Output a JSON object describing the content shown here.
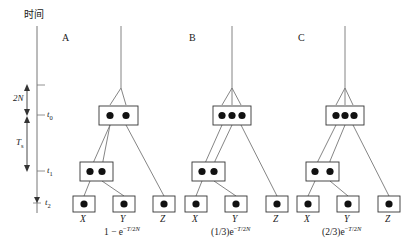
{
  "figure": {
    "width": 408,
    "height": 248,
    "background": "#ffffff",
    "ink_color": "#1a1a1a",
    "line_color": "#555555"
  },
  "axis": {
    "title": "时间",
    "title_meaning": "time",
    "ticks": [
      {
        "id": "t0",
        "label": "t",
        "sub": "0",
        "y": 115
      },
      {
        "id": "t1",
        "label": "t",
        "sub": "1",
        "y": 171
      },
      {
        "id": "t2",
        "label": "t",
        "sub": "2",
        "y": 203
      }
    ],
    "spans": [
      {
        "id": "span-2N",
        "label": "2N",
        "sub": "",
        "from_y": 85,
        "to_y": 115
      },
      {
        "id": "span-T",
        "label": "T",
        "sub": "s",
        "from_y": 117,
        "to_y": 171
      }
    ]
  },
  "panels": [
    {
      "letter": "A",
      "formula_parts": {
        "prefix": "1 − e",
        "exp_minus": "−",
        "exp_var": "T",
        "exp_div": "/2",
        "exp_n": "N"
      },
      "formula_plain": "1 − e−T/2N",
      "ancestral_dots": 2,
      "internal_dots": 2,
      "tips": [
        {
          "label": "X",
          "dots": 1
        },
        {
          "label": "Y",
          "dots": 1
        },
        {
          "label": "Z",
          "dots": 1
        }
      ]
    },
    {
      "letter": "B",
      "formula_parts": {
        "prefix": "(1/3)e",
        "exp_minus": "−",
        "exp_var": "T",
        "exp_div": "/2",
        "exp_n": "N"
      },
      "formula_plain": "(1/3)e−T/2N",
      "ancestral_dots": 3,
      "internal_dots": 2,
      "tips": [
        {
          "label": "X",
          "dots": 1
        },
        {
          "label": "Y",
          "dots": 1
        },
        {
          "label": "Z",
          "dots": 1
        }
      ]
    },
    {
      "letter": "C",
      "formula_parts": {
        "prefix": "(2/3)e",
        "exp_minus": "−",
        "exp_var": "T",
        "exp_div": "/2",
        "exp_n": "N"
      },
      "formula_plain": "(2/3)e−T/2N",
      "ancestral_dots": 3,
      "internal_dots": 2,
      "tips": [
        {
          "label": "X",
          "dots": 1
        },
        {
          "label": "Y",
          "dots": 1
        },
        {
          "label": "Z",
          "dots": 1
        }
      ]
    }
  ]
}
